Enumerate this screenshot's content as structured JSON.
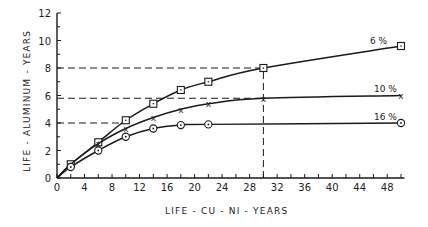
{
  "chart_data": {
    "type": "line",
    "title": "",
    "xlabel": "LIFE-CU-NI-YEARS",
    "ylabel": "LIFE-ALUMINUM-YEARS",
    "xlim": [
      0,
      50
    ],
    "ylim": [
      0,
      12
    ],
    "x_ticks": [
      0,
      4,
      8,
      12,
      16,
      20,
      24,
      28,
      32,
      36,
      40,
      44,
      48
    ],
    "y_ticks": [
      0,
      2,
      4,
      6,
      8,
      10,
      12
    ],
    "grid": false,
    "legend": "inline labels at line ends",
    "series": [
      {
        "name": "6 %",
        "marker": "square",
        "x": [
          0,
          2,
          6,
          10,
          14,
          18,
          22,
          30,
          50
        ],
        "y": [
          0,
          1.0,
          2.6,
          4.2,
          5.4,
          6.4,
          7.0,
          8.0,
          9.6
        ]
      },
      {
        "name": "10 %",
        "marker": "x",
        "x": [
          0,
          2,
          6,
          10,
          14,
          18,
          22,
          30,
          50
        ],
        "y": [
          0,
          1.0,
          2.5,
          3.6,
          4.4,
          5.0,
          5.4,
          5.8,
          6.0
        ]
      },
      {
        "name": "16 %",
        "marker": "circle",
        "x": [
          0,
          2,
          6,
          10,
          14,
          18,
          22,
          50
        ],
        "y": [
          0,
          0.8,
          2.0,
          3.0,
          3.6,
          3.85,
          3.9,
          4.0
        ]
      }
    ],
    "annotations": [
      {
        "type": "dashed-hline",
        "y": 8,
        "x_from": 0,
        "x_to": 30
      },
      {
        "type": "dashed-hline",
        "y": 5.8,
        "x_from": 0,
        "x_to": 30
      },
      {
        "type": "dashed-hline",
        "y": 4,
        "x_from": 0,
        "x_to": 10
      },
      {
        "type": "dashed-vline",
        "x": 30,
        "y_from": 0,
        "y_to": 8
      }
    ]
  },
  "labels": {
    "xlabel": "LIFE - CU - NI - YEARS",
    "ylabel": "LIFE - ALUMINUM - YEARS",
    "s6": "6 %",
    "s10": "10 %",
    "s16": "16 %"
  }
}
